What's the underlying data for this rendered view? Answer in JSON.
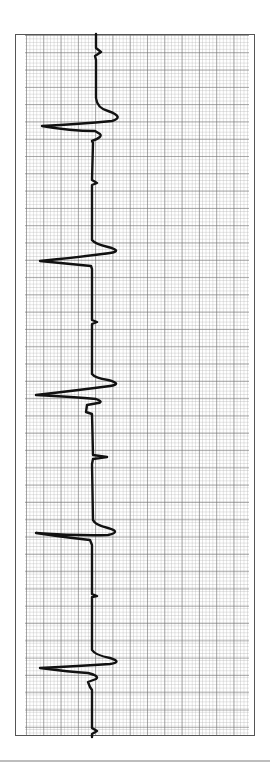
{
  "figure": {
    "type": "ecg-rhythm-strip",
    "orientation": "vertical",
    "colors": {
      "trace": "#111111",
      "grid_major": "#8a8a8a",
      "grid_minor": "#c8c8c8",
      "frame": "#555555",
      "separator": "#bdbdbd"
    },
    "grid": {
      "major_spacing_px": 17.3,
      "minor_per_major": 5
    },
    "trace_path": "M96,34 L96,48 L101,52 L95,56 L96,60 L96,98 Q97,108 108,111 Q125,117 112,121 Q80,124 42,126 Q70,131 95,131 L100,134 Q103,137 92,141 L93,143 L92,180 L97,183 L92,185 L92,240 Q95,244 108,247 Q123,251 110,253 Q80,257 40,261 Q70,264 91,266 L92,269 L92,320 L97,322 L92,324 L92,374 Q95,378 108,380 Q123,384 110,386 Q80,390 36,395 Q75,397 96,399 Q104,402 98,403 L87,405 L86,412 L92,414 L93,455 L107,457 L93,459 L92,464 L93,520 Q95,525 108,528 Q122,532 108,535 Q80,536 36,533 Q70,538 90,540 L92,545 L92,594 L97,596 L92,597 L92,650 Q95,655 110,658 Q123,662 110,664 Q80,666 40,668 Q70,672 88,673 Q100,676 96,679 L88,682 L90,687 L92,690 L92,728 L97,731 L92,734 L92,737",
    "beats": [
      {
        "qrs_center_y": 126,
        "r_peak_x": 42
      },
      {
        "qrs_center_y": 261,
        "r_peak_x": 40
      },
      {
        "qrs_center_y": 395,
        "r_peak_x": 36
      },
      {
        "qrs_center_y": 533,
        "r_peak_x": 36
      },
      {
        "qrs_center_y": 668,
        "r_peak_x": 40
      }
    ]
  }
}
